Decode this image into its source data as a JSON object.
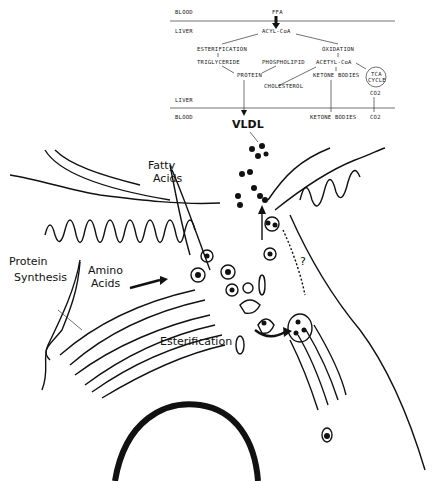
{
  "pathway": {
    "compartments": {
      "blood_top": "BLOOD",
      "liver_top": "LIVER",
      "liver_bottom": "LIVER",
      "blood_bottom": "BLOOD"
    },
    "nodes": {
      "ffa": "FFA",
      "acyl_coa": "ACYL-CoA",
      "esterification": "ESTERIFICATION",
      "oxidation": "OXIDATION",
      "triglyceride": "TRIGLYCERIDE",
      "phospholipid": "PHOSPHOLIPID",
      "acetyl_coa": "ACETYL-CoA",
      "protein": "PROTEIN",
      "ketone_bodies": "KETONE BODIES",
      "tca_line1": "TCA",
      "tca_line2": "CYCLE",
      "cholesterol": "CHOLESTEROL",
      "co2_liver": "CO2",
      "ketone_bodies_blood": "KETONE BODIES",
      "co2_blood": "CO2",
      "vldl": "VLDL"
    }
  },
  "illustration": {
    "labels": {
      "fatty_acids_1": "Fatty",
      "fatty_acids_2": "Acids",
      "protein_synthesis_1": "Protein",
      "protein_synthesis_2": "Synthesis",
      "amino_acids_1": "Amino",
      "amino_acids_2": "Acids",
      "esterification": "Esterification",
      "unknown_pathway": "?"
    }
  },
  "colors": {
    "ink": "#111111",
    "background": "#ffffff"
  }
}
